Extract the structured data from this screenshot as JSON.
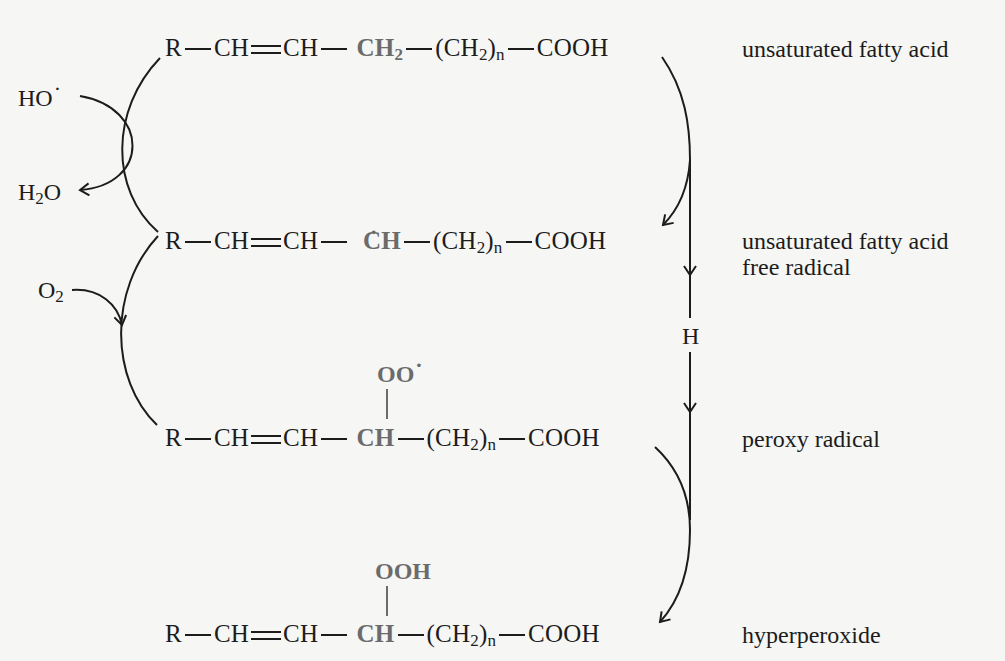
{
  "diagram": {
    "colors": {
      "background": "#f6f6f4",
      "text": "#1c1c1c",
      "highlight": "#6b6b6b"
    },
    "rows": [
      {
        "id": "unsaturated-fatty-acid",
        "formula": {
          "r": "R",
          "ch1": "CH",
          "ch2": "CH",
          "center": "CH",
          "center_sub": "2",
          "chain_open": "(CH",
          "chain_sub": "2",
          "chain_close": ")",
          "chain_n": "n",
          "acid": "COOH"
        },
        "label": "unsaturated fatty acid"
      },
      {
        "id": "unsaturated-fatty-acid-free-radical",
        "formula": {
          "r": "R",
          "ch1": "CH",
          "ch2": "CH",
          "center": "CH",
          "center_dot": "·",
          "chain_open": "(CH",
          "chain_sub": "2",
          "chain_close": ")",
          "chain_n": "n",
          "acid": "COOH"
        },
        "label_line1": "unsaturated fatty acid",
        "label_line2": "free radical"
      },
      {
        "id": "peroxy-radical",
        "substituent": "OO",
        "substituent_dot": "·",
        "formula": {
          "r": "R",
          "ch1": "CH",
          "ch2": "CH",
          "center": "CH",
          "chain_open": "(CH",
          "chain_sub": "2",
          "chain_close": ")",
          "chain_n": "n",
          "acid": "COOH"
        },
        "label": "peroxy radical"
      },
      {
        "id": "hyperperoxide",
        "substituent": "OOH",
        "formula": {
          "r": "R",
          "ch1": "CH",
          "ch2": "CH",
          "center": "CH",
          "chain_open": "(CH",
          "chain_sub": "2",
          "chain_close": ")",
          "chain_n": "n",
          "acid": "COOH"
        },
        "label": "hyperperoxide"
      }
    ],
    "reagents": {
      "hydroxyl_radical": "HO",
      "hydroxyl_dot": "·",
      "water_h": "H",
      "water_sub": "2",
      "water_o": "O",
      "oxygen": "O",
      "oxygen_sub": "2",
      "hydrogen": "H"
    },
    "icons": [
      "curved-arrow-icon",
      "straight-arrow-icon"
    ]
  }
}
